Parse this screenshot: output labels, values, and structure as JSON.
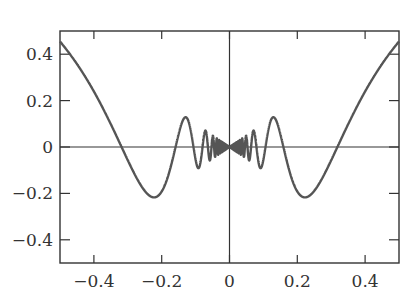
{
  "chart_data": {
    "type": "line",
    "title": "",
    "xlabel": "",
    "ylabel": "",
    "xlim": [
      -0.5,
      0.5
    ],
    "ylim": [
      -0.5,
      0.5
    ],
    "grid": false,
    "legend": null,
    "function": "x*sin(1/x)",
    "x_ticks": [
      -0.4,
      -0.2,
      0,
      0.2,
      0.4
    ],
    "x_tick_labels": [
      "−0.4",
      "−0.2",
      "0",
      "0.2",
      "0.4"
    ],
    "y_ticks": [
      0.4,
      0.2,
      0,
      -0.2,
      -0.4
    ],
    "y_tick_labels": [
      "0.4",
      "0.2",
      "0",
      "−0.2",
      "−0.4"
    ],
    "series": [
      {
        "name": "x sin(1/x)",
        "color": "#555555",
        "sample_points": [
          [
            -0.5,
            0.455
          ],
          [
            -0.4,
            0.239
          ],
          [
            -0.318,
            0.0
          ],
          [
            -0.3,
            -0.057
          ],
          [
            -0.25,
            -0.189
          ],
          [
            -0.22,
            -0.217
          ],
          [
            -0.2,
            -0.192
          ],
          [
            -0.159,
            0.0
          ],
          [
            -0.13,
            0.128
          ],
          [
            -0.106,
            0.0
          ],
          [
            -0.09,
            -0.09
          ],
          [
            -0.08,
            -0.0
          ],
          [
            -0.07,
            0.069
          ],
          [
            0,
            0
          ],
          [
            0.07,
            0.069
          ],
          [
            0.08,
            -0.0
          ],
          [
            0.09,
            -0.09
          ],
          [
            0.106,
            0.0
          ],
          [
            0.13,
            0.128
          ],
          [
            0.159,
            0.0
          ],
          [
            0.2,
            -0.192
          ],
          [
            0.22,
            -0.217
          ],
          [
            0.25,
            -0.189
          ],
          [
            0.3,
            -0.057
          ],
          [
            0.318,
            0.0
          ],
          [
            0.4,
            0.239
          ],
          [
            0.5,
            0.455
          ]
        ]
      }
    ],
    "axes_lines": {
      "x_axis_at": 0,
      "y_axis_at": 0
    }
  },
  "colors": {
    "frame": "#333333",
    "axis": "#333333",
    "curve": "#555555",
    "text": "#333333"
  }
}
